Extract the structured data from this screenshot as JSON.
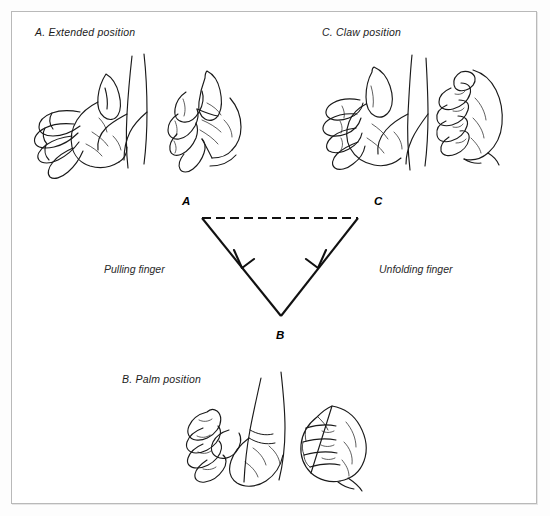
{
  "figure": {
    "background_color": "#ffffff",
    "border_color": "#b9b9b9",
    "ink_color": "#1a1a1a",
    "panels": [
      {
        "key": "a",
        "caption": "A.  Extended position"
      },
      {
        "key": "c",
        "caption": "C.  Claw position"
      },
      {
        "key": "b",
        "caption": "B.  Palm position"
      }
    ],
    "captions": {
      "extended": "A.  Extended position",
      "claw": "C.  Claw position",
      "palm": "B.  Palm position"
    },
    "diagram": {
      "vertices": [
        {
          "id": "A",
          "label": "A"
        },
        {
          "id": "C",
          "label": "C"
        },
        {
          "id": "B",
          "label": "B"
        }
      ],
      "edges": [
        {
          "from": "A",
          "to": "C",
          "style": "dashed",
          "arrow": false,
          "label": ""
        },
        {
          "from": "A",
          "to": "B",
          "style": "solid",
          "arrow": true,
          "label": "Pulling finger"
        },
        {
          "from": "C",
          "to": "B",
          "style": "solid",
          "arrow": true,
          "label": "Unfolding finger"
        }
      ],
      "edge_labels": {
        "left": "Pulling finger",
        "right": "Unfolding finger"
      }
    },
    "illustrations": [
      {
        "name": "extended-hand-lateral",
        "panel": "a"
      },
      {
        "name": "extended-hand-frontal",
        "panel": "a"
      },
      {
        "name": "claw-hand-lateral",
        "panel": "c"
      },
      {
        "name": "claw-hand-frontal",
        "panel": "c"
      },
      {
        "name": "palm-fist-lateral",
        "panel": "b"
      },
      {
        "name": "palm-fist-frontal",
        "panel": "b"
      }
    ]
  }
}
